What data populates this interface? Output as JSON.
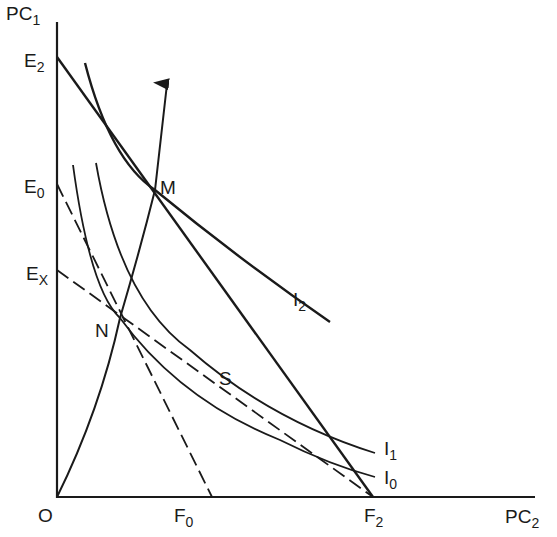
{
  "axes": {
    "y_label": "PC",
    "y_label_sub": "1",
    "x_label": "PC",
    "x_label_sub": "2",
    "origin_label": "O"
  },
  "points": {
    "E2": {
      "main": "E",
      "sub": "2"
    },
    "E0": {
      "main": "E",
      "sub": "0"
    },
    "Ex": {
      "main": "E",
      "sub": "X"
    },
    "F0": {
      "main": "F",
      "sub": "0"
    },
    "F2": {
      "main": "F",
      "sub": "2"
    },
    "M": "M",
    "N": "N",
    "S": "S"
  },
  "curves": {
    "I2": {
      "main": "I",
      "sub": "2"
    },
    "I1": {
      "main": "I",
      "sub": "1"
    },
    "I0": {
      "main": "I",
      "sub": "0"
    }
  },
  "lines": [
    {
      "name": "budget-E2-F2",
      "style": "solid",
      "from": "E2",
      "to": "F2"
    },
    {
      "name": "budget-E0-F0",
      "style": "dashed",
      "from": "E0",
      "to": "F0"
    },
    {
      "name": "budget-Ex-F2",
      "style": "dashed",
      "from": "Ex",
      "to": "F2"
    },
    {
      "name": "expansion-path",
      "style": "solid-arrow",
      "from": "O",
      "through": [
        "N",
        "M"
      ]
    }
  ],
  "colors": {
    "ink": "#1a1a1a",
    "background": "#ffffff"
  }
}
